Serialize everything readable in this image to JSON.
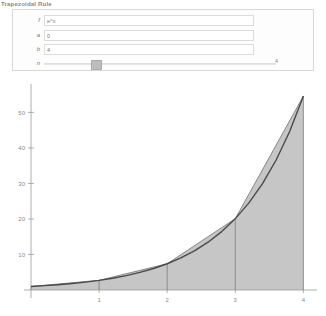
{
  "app": {
    "title": "Trapezoidal Rule"
  },
  "controls": {
    "rows": [
      {
        "label": "f",
        "value": "e^x"
      },
      {
        "label": "a",
        "value": "0"
      },
      {
        "label": "b",
        "value": "4"
      }
    ],
    "slider": {
      "label": "n",
      "value": "4",
      "min": 1,
      "max": 50,
      "current": 4,
      "fill_percent": 7
    }
  },
  "chart_data": {
    "type": "area",
    "title": "",
    "xlabel": "",
    "ylabel": "",
    "xlim": [
      0,
      4.2
    ],
    "ylim": [
      0,
      58
    ],
    "xticks": [
      1,
      2,
      3,
      4
    ],
    "yticks": [
      10,
      20,
      30,
      40,
      50
    ],
    "grid": false,
    "legend": null,
    "curve": {
      "name": "e^x",
      "color": "#4a4a4a",
      "x": [
        0,
        0.2,
        0.4,
        0.6,
        0.8,
        1,
        1.2,
        1.4,
        1.6,
        1.8,
        2,
        2.2,
        2.4,
        2.6,
        2.8,
        3,
        3.2,
        3.4,
        3.6,
        3.8,
        4
      ],
      "y": [
        1,
        1.22,
        1.49,
        1.82,
        2.23,
        2.72,
        3.32,
        4.06,
        4.95,
        6.05,
        7.39,
        9.03,
        11.02,
        13.46,
        16.44,
        20.09,
        24.53,
        29.96,
        36.6,
        44.7,
        54.6
      ]
    },
    "trapezoids": {
      "fill_color": "#c6c6c6",
      "edge_color": "#6e6e6e",
      "nodes_x": [
        0,
        1,
        2,
        3,
        4
      ],
      "nodes_y": [
        1,
        2.72,
        7.39,
        20.09,
        54.6
      ]
    }
  }
}
